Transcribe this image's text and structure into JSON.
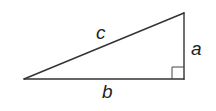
{
  "diagram": {
    "type": "right-triangle",
    "colors": {
      "stroke": "#333333",
      "label": "#222222",
      "background": "#ffffff"
    },
    "vertices": {
      "left": [
        24,
        79
      ],
      "right_angle": [
        184,
        79
      ],
      "top": [
        184,
        13
      ]
    },
    "right_angle_marker": {
      "corner": "bottom-right",
      "size": 12
    },
    "labels": {
      "hypotenuse": "c",
      "vertical_leg": "a",
      "horizontal_leg": "b"
    }
  }
}
